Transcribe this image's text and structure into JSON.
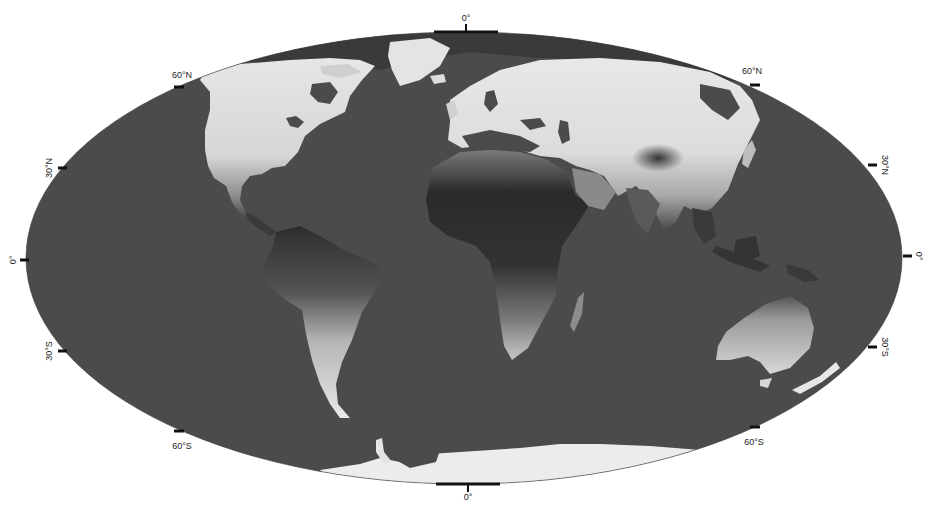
{
  "map": {
    "projection": "Mollweide",
    "colors": {
      "background": "#ffffff",
      "ocean": "#4b4b4b",
      "land_light": "#e8e8e8",
      "land_dark": "#2a2a2a",
      "tick": "#111111"
    },
    "labels": {
      "top_meridian": "0°",
      "bottom_meridian": "0°",
      "left_60n": "60°N",
      "left_30n": "30°N",
      "left_equator": "0°",
      "left_30s": "30°S",
      "left_60s": "60°S",
      "right_60n": "60°N",
      "right_30n": "30°N",
      "right_equator": "0°",
      "right_30s": "30°S",
      "right_60s": "60°S"
    }
  }
}
